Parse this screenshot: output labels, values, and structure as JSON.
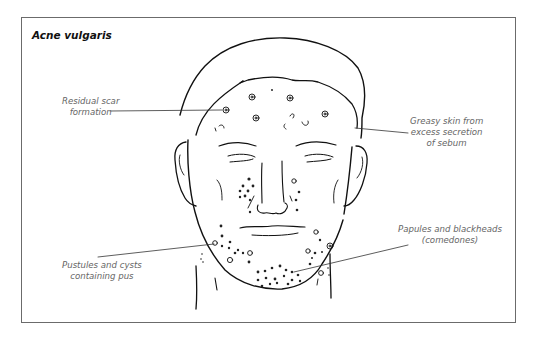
{
  "figure": {
    "title": "Acne vulgaris",
    "labels": {
      "scar": {
        "line1": "Residual scar",
        "line2": "formation"
      },
      "greasy": {
        "line1": "Greasy skin from",
        "line2": "excess secretion",
        "line3": "of sebum"
      },
      "pustules": {
        "line1": "Pustules and cysts",
        "line2": "containing pus"
      },
      "papules": {
        "line1": "Papules and blackheads",
        "line2": "(comedones)"
      }
    },
    "colors": {
      "line": "#111111",
      "label_text": "#666666",
      "frame": "#6b6b6b"
    }
  }
}
